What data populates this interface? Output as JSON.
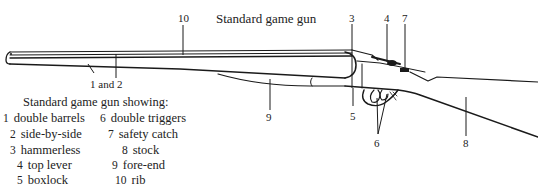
{
  "title": "Standard game gun",
  "callouts": [
    {
      "id": "10",
      "label": "10"
    },
    {
      "id": "3",
      "label": "3"
    },
    {
      "id": "4",
      "label": "4"
    },
    {
      "id": "7",
      "label": "7"
    },
    {
      "id": "1and2",
      "label": "1 and 2"
    },
    {
      "id": "9",
      "label": "9"
    },
    {
      "id": "5",
      "label": "5"
    },
    {
      "id": "6",
      "label": "6"
    },
    {
      "id": "8",
      "label": "8"
    }
  ],
  "legend": {
    "title": "Standard game gun showing:",
    "items": [
      {
        "num": "1",
        "label": "double barrels"
      },
      {
        "num": "2",
        "label": "side-by-side"
      },
      {
        "num": "3",
        "label": "hammerless"
      },
      {
        "num": "4",
        "label": "top lever"
      },
      {
        "num": "5",
        "label": "boxlock"
      },
      {
        "num": "6",
        "label": "double triggers"
      },
      {
        "num": "7",
        "label": "safety catch"
      },
      {
        "num": "8",
        "label": "stock"
      },
      {
        "num": "9",
        "label": "fore-end"
      },
      {
        "num": "10",
        "label": "rib"
      }
    ]
  },
  "colors": {
    "ink": "#1a1a1a",
    "background": "#ffffff"
  }
}
